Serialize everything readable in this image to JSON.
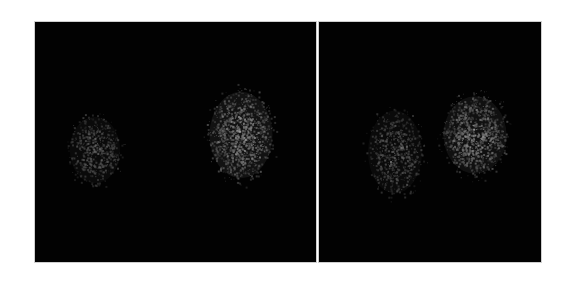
{
  "figure": {
    "background": "#ffffff",
    "panel_background": "#020202",
    "panels": [
      {
        "id": "left",
        "x": 35,
        "y": 22,
        "width": 281,
        "height": 240,
        "blobs": [
          {
            "cx": 60,
            "cy": 128,
            "rx": 28,
            "ry": 37,
            "intensity": 0.28,
            "density": 520,
            "seed": 11
          },
          {
            "cx": 206,
            "cy": 113,
            "rx": 35,
            "ry": 48,
            "intensity": 0.55,
            "density": 1100,
            "seed": 23
          }
        ]
      },
      {
        "id": "right",
        "x": 319,
        "y": 22,
        "width": 222,
        "height": 240,
        "blobs": [
          {
            "cx": 76,
            "cy": 130,
            "rx": 30,
            "ry": 46,
            "intensity": 0.3,
            "density": 650,
            "seed": 37
          },
          {
            "cx": 156,
            "cy": 113,
            "rx": 35,
            "ry": 43,
            "intensity": 0.5,
            "density": 1000,
            "seed": 51
          }
        ]
      }
    ]
  }
}
